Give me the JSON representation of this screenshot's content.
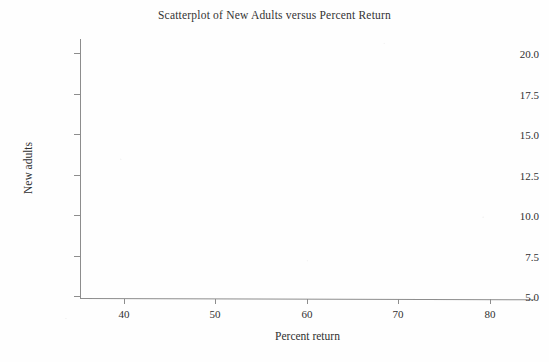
{
  "figure": {
    "background_color": "#fefefe",
    "axis_color": "#8d8d8d",
    "text_color": "#303030"
  },
  "chart_data": {
    "type": "scatter",
    "title": "Scatterplot of New Adults versus Percent Return",
    "xlabel": "Percent return",
    "ylabel": "New adults",
    "x": [],
    "y": [],
    "series": [
      {
        "name": "New adults vs Percent return",
        "x": [],
        "y": []
      }
    ],
    "xlim": [
      35.2,
      84.9
    ],
    "ylim": [
      4.1,
      20.9
    ],
    "xticks": [
      40,
      50,
      60,
      70,
      80
    ],
    "xtick_labels": [
      "40",
      "50",
      "60",
      "70",
      "80"
    ],
    "yticks": [
      5.0,
      7.5,
      10.0,
      12.5,
      15.0,
      17.5,
      20.0
    ],
    "ytick_labels": [
      "5.0",
      "7.5",
      "10.0",
      "12.5",
      "15.0",
      "17.5",
      "20.0"
    ],
    "grid": false,
    "legend": null,
    "legend_position": "none",
    "annotations": [],
    "note": "Plot region is blank - no data markers are drawn in this figure"
  }
}
